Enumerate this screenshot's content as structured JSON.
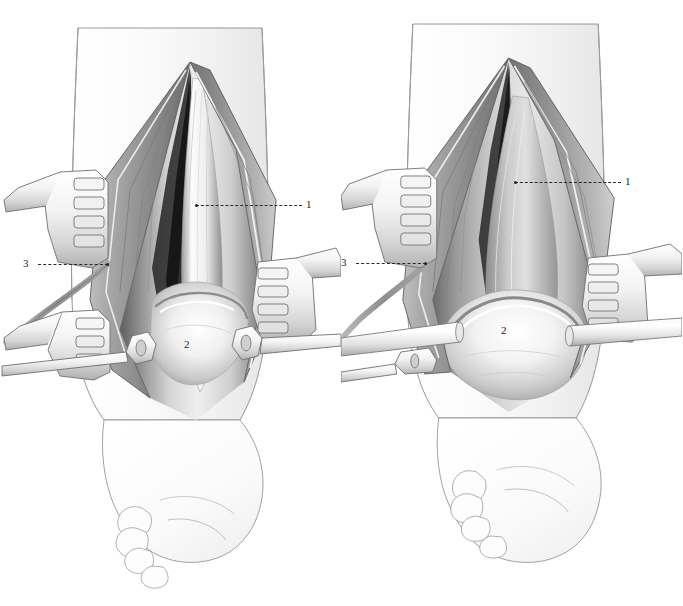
{
  "figure": {
    "background_color": "#ffffff",
    "ink_color": "#2a2a2a",
    "panel_count": 2,
    "width": 683,
    "height": 606
  },
  "panels": [
    {
      "id": "left",
      "name": "panel-left",
      "caption": "",
      "stage": "Initial exposure — extensor retinaculum incised, tendons retracted",
      "callouts": [
        {
          "key": "1",
          "label": "1",
          "target": "extensor tendon / retinaculum edge",
          "label_x": 306,
          "label_y": 199,
          "line_x": 196,
          "line_y": 205,
          "line_w": 106
        },
        {
          "key": "2",
          "label": "2",
          "target": "talus / anterior ankle joint",
          "label_x": 184,
          "label_y": 339,
          "line_x": 0,
          "line_y": 0,
          "line_w": 0
        },
        {
          "key": "3",
          "label": "3",
          "target": "superficial peroneal nerve branch",
          "label_x": 23,
          "label_y": 258,
          "line_x": 38,
          "line_y": 264,
          "line_w": 70
        }
      ],
      "instruments": [
        {
          "name": "rake-retractor",
          "position": "upper-left",
          "prongs": 4
        },
        {
          "name": "rake-retractor",
          "position": "lower-left",
          "prongs": 3
        },
        {
          "name": "rake-retractor",
          "position": "right",
          "prongs": 4
        },
        {
          "name": "hohmann-retractor",
          "position": "center-left",
          "blade": "slotted"
        },
        {
          "name": "hohmann-retractor",
          "position": "center-right",
          "blade": "slotted"
        }
      ]
    },
    {
      "id": "right",
      "name": "panel-right",
      "caption": "",
      "stage": "Deep exposure — capsule opened, talar dome visible",
      "callouts": [
        {
          "key": "1",
          "label": "1",
          "target": "extensor tendon / retinaculum edge",
          "label_x": 625,
          "label_y": 176,
          "line_x": 515,
          "line_y": 182,
          "line_w": 106
        },
        {
          "key": "2",
          "label": "2",
          "target": "talar dome",
          "label_x": 501,
          "label_y": 325,
          "line_x": 0,
          "line_y": 0,
          "line_w": 0
        },
        {
          "key": "3",
          "label": "3",
          "target": "superficial peroneal nerve branch",
          "label_x": 341,
          "label_y": 257,
          "line_x": 356,
          "line_y": 263,
          "line_w": 70
        }
      ],
      "instruments": [
        {
          "name": "rake-retractor",
          "position": "upper-left",
          "prongs": 4
        },
        {
          "name": "rake-retractor",
          "position": "right",
          "prongs": 4
        },
        {
          "name": "hohmann-retractor",
          "position": "center-left",
          "blade": "cylindrical"
        },
        {
          "name": "hohmann-retractor",
          "position": "center-right",
          "blade": "cylindrical"
        }
      ]
    }
  ],
  "legend": {
    "entries": [
      {
        "key": "1",
        "text": "1"
      },
      {
        "key": "2",
        "text": "2"
      },
      {
        "key": "3",
        "text": "3"
      }
    ]
  }
}
